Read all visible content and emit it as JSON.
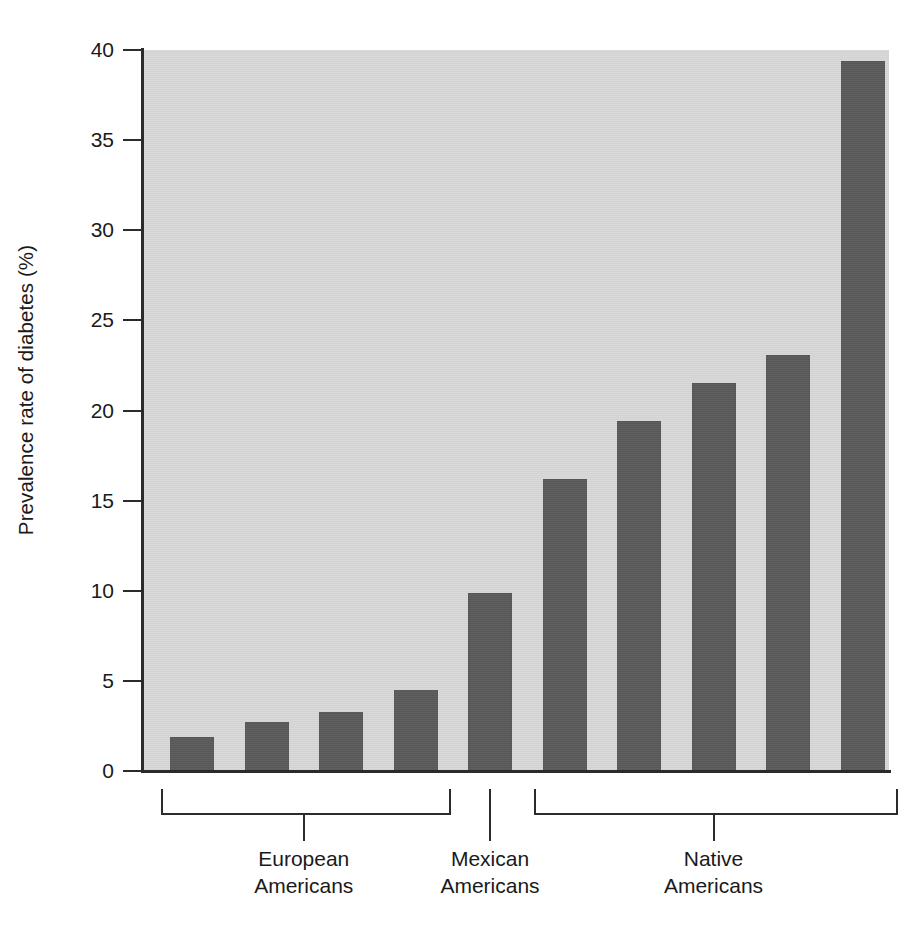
{
  "chart_data": {
    "type": "bar",
    "title": "",
    "subtitle": "",
    "xlabel": "",
    "ylabel": "Prevalence rate of diabetes (%)",
    "ylim": [
      0,
      40
    ],
    "ytick_labels": [
      "40",
      "35",
      "30",
      "25",
      "20",
      "15",
      "10",
      "5",
      "0"
    ],
    "ytick_values": [
      40,
      35,
      30,
      25,
      20,
      15,
      10,
      5,
      0
    ],
    "grid": false,
    "legend": null,
    "bar_color": "#5a5a5a",
    "panel_color": "#d7d7d7",
    "axis_color": "#2b2b2b",
    "categories": [
      "bar-1",
      "bar-2",
      "bar-3",
      "bar-4",
      "bar-5",
      "bar-6",
      "bar-7",
      "bar-8",
      "bar-9",
      "bar-10"
    ],
    "values": [
      1.9,
      2.7,
      3.3,
      4.5,
      9.9,
      16.2,
      19.4,
      21.5,
      23.1,
      39.4
    ],
    "groups": [
      {
        "label_line1": "European",
        "label_line2": "Americans",
        "bar_indices": [
          0,
          1,
          2,
          3
        ],
        "bracket": "span"
      },
      {
        "label_line1": "Mexican",
        "label_line2": "Americans",
        "bar_indices": [
          4
        ],
        "bracket": "single"
      },
      {
        "label_line1": "Native",
        "label_line2": "Americans",
        "bar_indices": [
          5,
          6,
          7,
          8,
          9
        ],
        "bracket": "span"
      }
    ]
  },
  "axis": {
    "y_title": "Prevalence rate of diabetes (%)",
    "t0": "40",
    "t1": "35",
    "t2": "30",
    "t3": "25",
    "t4": "20",
    "t5": "15",
    "t6": "10",
    "t7": "5",
    "t8": "0"
  },
  "groups": {
    "european": {
      "line1": "European",
      "line2": "Americans"
    },
    "mexican": {
      "line1": "Mexican",
      "line2": "Americans"
    },
    "native": {
      "line1": "Native",
      "line2": "Americans"
    }
  }
}
